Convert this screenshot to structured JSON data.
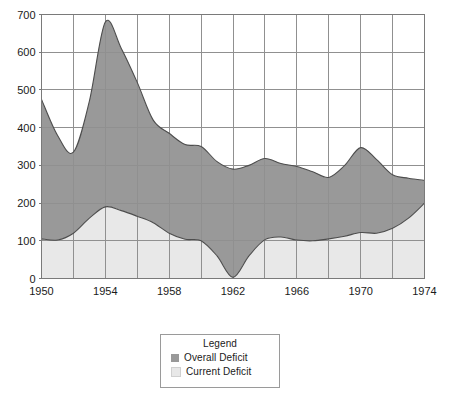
{
  "chart_data": {
    "type": "area",
    "title": "",
    "xlabel": "",
    "ylabel": "",
    "xlim": [
      1950,
      1974
    ],
    "ylim": [
      0,
      700
    ],
    "ytick_values": [
      0,
      100,
      200,
      300,
      400,
      500,
      600,
      700
    ],
    "ytick_labels": [
      "0",
      "100",
      "200",
      "300",
      "400",
      "500",
      "600",
      "700"
    ],
    "xtick_values": [
      1950,
      1954,
      1958,
      1962,
      1966,
      1970,
      1974
    ],
    "xtick_labels": [
      "1950",
      "1954",
      "1958",
      "1962",
      "1966",
      "1970",
      "1974"
    ],
    "x_gridline_values": [
      1950,
      1952,
      1954,
      1956,
      1958,
      1960,
      1962,
      1964,
      1966,
      1968,
      1970,
      1972,
      1974
    ],
    "grid": "horizontal-and-vertical",
    "legend_position": "below-plot-center",
    "x": [
      1950,
      1951,
      1952,
      1953,
      1954,
      1955,
      1956,
      1957,
      1958,
      1959,
      1960,
      1961,
      1962,
      1963,
      1964,
      1965,
      1966,
      1967,
      1968,
      1969,
      1970,
      1971,
      1972,
      1973,
      1974
    ],
    "series": [
      {
        "name": "Overall Deficit",
        "color": "#999999",
        "values": [
          475,
          380,
          335,
          470,
          680,
          610,
          520,
          420,
          385,
          355,
          350,
          310,
          290,
          300,
          318,
          305,
          297,
          283,
          268,
          300,
          347,
          315,
          275,
          266,
          260
        ]
      },
      {
        "name": "Current Deficit",
        "color": "#e8e8e8",
        "values": [
          105,
          102,
          120,
          160,
          190,
          180,
          165,
          148,
          120,
          104,
          100,
          60,
          3,
          60,
          103,
          110,
          102,
          100,
          105,
          112,
          122,
          120,
          133,
          160,
          200
        ]
      }
    ]
  },
  "legend": {
    "title": "Legend",
    "items": [
      {
        "label": "Overall Deficit",
        "color": "#999999"
      },
      {
        "label": "Current Deficit",
        "color": "#e8e8e8"
      }
    ]
  },
  "colors": {
    "overall_deficit": "#999999",
    "current_deficit": "#e8e8e8",
    "grid": "#909090",
    "axis": "#7a7a7a",
    "line": "#4d4d4d",
    "text": "#1a1a1a",
    "background": "#ffffff"
  },
  "footer": {
    "cutoff_text": ""
  }
}
